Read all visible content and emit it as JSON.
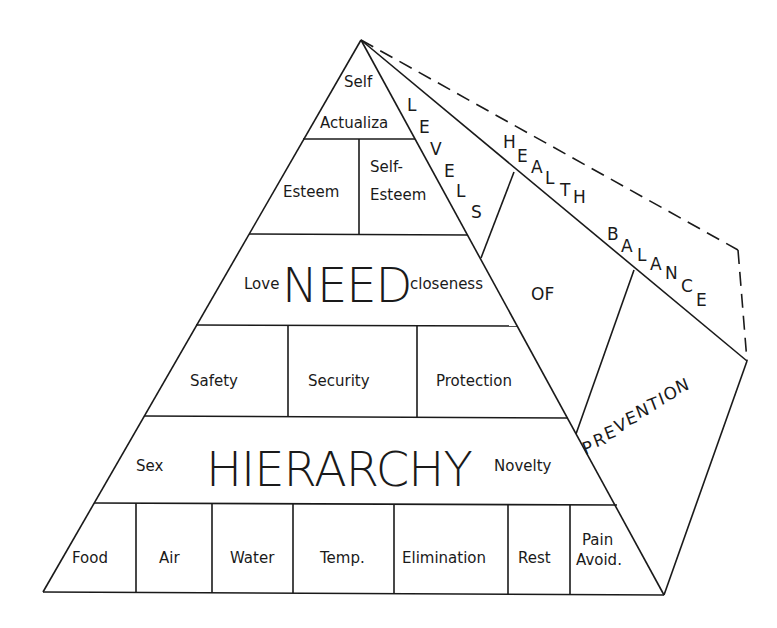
{
  "diagram": {
    "pyramid": {
      "tiers": [
        {
          "id": "self-actualization",
          "cells": [
            "Self",
            "Actualiza"
          ]
        },
        {
          "id": "esteem",
          "cells": [
            "Esteem",
            "Self-",
            "Esteem"
          ]
        },
        {
          "id": "love",
          "left": "Love",
          "center": "NEED",
          "right": "closeness"
        },
        {
          "id": "safety",
          "cells": [
            "Safety",
            "Security",
            "Protection"
          ]
        },
        {
          "id": "sex",
          "left": "Sex",
          "center": "HIERARCHY",
          "right": "Novelty"
        },
        {
          "id": "physiological",
          "cells": [
            "Food",
            "Air",
            "Water",
            "Temp.",
            "Elimination",
            "Rest",
            "Pain",
            "Avoid."
          ]
        }
      ]
    },
    "side_face": {
      "levels_letters": [
        "L",
        "E",
        "V",
        "E",
        "L",
        "S"
      ],
      "of_label": "OF",
      "prevention_letters": [
        "P",
        "R",
        "E",
        "V",
        "E",
        "N",
        "T",
        "I",
        "O",
        "N"
      ],
      "health_letters": [
        "H",
        "E",
        "A",
        "L",
        "T",
        "H"
      ],
      "balance_letters": [
        "B",
        "A",
        "L",
        "A",
        "N",
        "C",
        "E"
      ]
    },
    "colors": {
      "line": "#1a1a1a",
      "background": "#ffffff"
    }
  }
}
